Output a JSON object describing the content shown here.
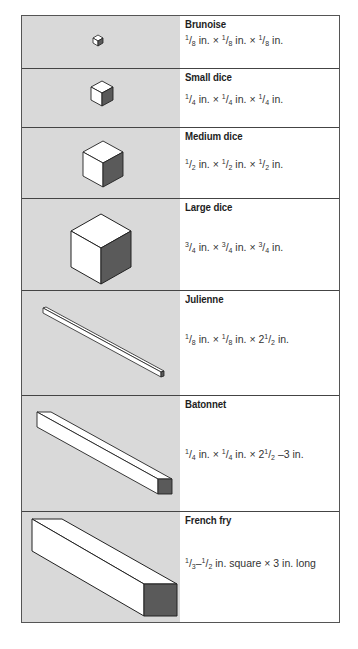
{
  "table": {
    "rows": [
      {
        "name": "Brunoise",
        "size": "1/8 in. × 1/8 in. × 1/8 in.",
        "icon": "tiny-cube-icon"
      },
      {
        "name": "Small dice",
        "size": "1/4 in. × 1/4 in. × 1/4 in.",
        "icon": "small-cube-icon"
      },
      {
        "name": "Medium dice",
        "size": "1/2 in. × 1/2 in. × 1/2 in.",
        "icon": "medium-cube-icon"
      },
      {
        "name": "Large dice",
        "size": "3/4 in. × 3/4 in. × 3/4 in.",
        "icon": "large-cube-icon"
      },
      {
        "name": "Julienne",
        "size": "1/8 in. × 1/8 in. × 2 1/2 in.",
        "icon": "thin-stick-icon"
      },
      {
        "name": "Batonnet",
        "size": "1/4 in. × 1/4 in. × 2 1/2 –3 in.",
        "icon": "medium-stick-icon"
      },
      {
        "name": "French fry",
        "size": "1/3–1/2 in. square × 3 in. long",
        "icon": "thick-stick-icon"
      }
    ]
  },
  "colors": {
    "illustration_bg": "#d9d9d9",
    "face_light": "#ffffff",
    "face_dark": "#5a5a5a",
    "border": "#444444"
  }
}
